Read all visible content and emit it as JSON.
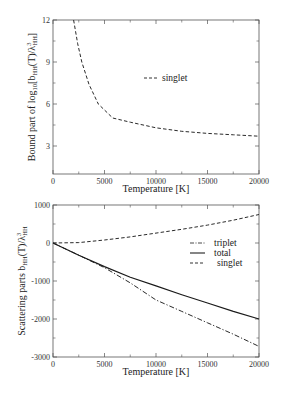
{
  "chart_data": [
    {
      "type": "line",
      "title": "",
      "xlabel": "Temperature [K]",
      "ylabel": "Bound part of log10[bHH(T)/λ³HH]",
      "xlim": [
        0,
        20000
      ],
      "ylim": [
        1,
        12
      ],
      "xticks": [
        "0",
        "5000",
        "10000",
        "15000",
        "20000"
      ],
      "yticks": [
        "3",
        "6",
        "9",
        "12"
      ],
      "grid": false,
      "legend_position": "upper-right-inside",
      "series": [
        {
          "name": "singlet",
          "style": "dashed",
          "x": [
            2000,
            2400,
            2800,
            3500,
            4400,
            5800,
            7500,
            10000,
            12500,
            15000,
            17500,
            20000
          ],
          "y": [
            12.0,
            10.3,
            9.0,
            7.4,
            6.0,
            5.0,
            4.7,
            4.3,
            4.05,
            3.9,
            3.8,
            3.7
          ]
        }
      ]
    },
    {
      "type": "line",
      "title": "",
      "xlabel": "Temperature [K]",
      "ylabel": "Scattering parts bHH(T)/λ³HH",
      "xlim": [
        0,
        20000
      ],
      "ylim": [
        -3000,
        1000
      ],
      "xticks": [
        "0",
        "5000",
        "10000",
        "15000",
        "20000"
      ],
      "yticks": [
        "-3000",
        "-2000",
        "-1000",
        "0",
        "1000"
      ],
      "grid": false,
      "legend_position": "upper-right-inside",
      "series": [
        {
          "name": "triplet",
          "style": "dash-dot",
          "x": [
            0,
            2500,
            5000,
            7500,
            10000,
            12500,
            15000,
            17500,
            20000
          ],
          "y": [
            0,
            -320,
            -650,
            -1050,
            -1500,
            -1800,
            -2100,
            -2400,
            -2720
          ]
        },
        {
          "name": "total",
          "style": "solid",
          "x": [
            0,
            2500,
            5000,
            7500,
            10000,
            12500,
            15000,
            17500,
            20000
          ],
          "y": [
            0,
            -320,
            -620,
            -900,
            -1130,
            -1360,
            -1580,
            -1800,
            -2000
          ]
        },
        {
          "name": "singlet",
          "style": "dashed",
          "x": [
            0,
            2500,
            5000,
            7500,
            10000,
            12500,
            15000,
            17500,
            20000
          ],
          "y": [
            0,
            10,
            80,
            160,
            260,
            360,
            470,
            600,
            750
          ]
        }
      ]
    }
  ],
  "labels": {
    "top": {
      "xlabel": "Temperature [K]",
      "ylabel_main": "Bound part of log",
      "ylabel_sub10": "10",
      "ylabel_rest": "[b",
      "ylabel_subHH": "HH",
      "ylabel_rest2": "(T)/λ",
      "ylabel_sup3": "3",
      "ylabel_subHH2": "HH",
      "ylabel_end": "]",
      "legend": [
        "singlet"
      ]
    },
    "bottom": {
      "xlabel": "Temperature [K]",
      "ylabel_main": "Scattering parts b",
      "ylabel_subHH": "HH",
      "ylabel_rest": "(T)/λ",
      "ylabel_sup3": "3",
      "ylabel_subHH2": "HH",
      "legend": [
        "triplet",
        "total",
        "singlet"
      ]
    }
  }
}
